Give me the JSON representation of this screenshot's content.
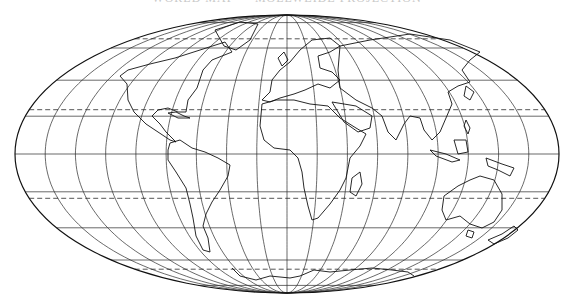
{
  "map": {
    "title": "WORLD MAP — MOLLWEIDE PROJECTION",
    "projection": "Mollweide",
    "center": [
      287,
      154
    ],
    "rx": 272,
    "ry": 139,
    "colors": {
      "line": "#111111",
      "background": "#ffffff"
    },
    "graticule": {
      "meridian_step_deg": 20,
      "solid_parallels_deg": [
        -80,
        -60,
        -40,
        -20,
        0,
        20,
        40,
        60,
        80
      ],
      "dashed_parallels_deg": [
        66.5,
        23.5,
        -23.5,
        -66.5
      ],
      "dashed_labels": [
        "Arctic Circle",
        "Tropic of Cancer",
        "Tropic of Capricorn",
        "Antarctic Circle"
      ]
    },
    "landmasses": [
      {
        "name": "North America",
        "points": [
          [
            128,
            70
          ],
          [
            150,
            64
          ],
          [
            175,
            58
          ],
          [
            200,
            50
          ],
          [
            225,
            42
          ],
          [
            232,
            52
          ],
          [
            212,
            60
          ],
          [
            203,
            70
          ],
          [
            197,
            88
          ],
          [
            188,
            100
          ],
          [
            186,
            112
          ],
          [
            178,
            112
          ],
          [
            168,
            108
          ],
          [
            158,
            110
          ],
          [
            152,
            116
          ],
          [
            160,
            124
          ],
          [
            166,
            132
          ],
          [
            172,
            138
          ],
          [
            176,
            142
          ],
          [
            170,
            140
          ],
          [
            158,
            132
          ],
          [
            146,
            124
          ],
          [
            134,
            112
          ],
          [
            128,
            100
          ],
          [
            127,
            84
          ],
          [
            120,
            76
          ],
          [
            128,
            70
          ]
        ]
      },
      {
        "name": "Greenland",
        "points": [
          [
            215,
            30
          ],
          [
            240,
            22
          ],
          [
            258,
            24
          ],
          [
            250,
            40
          ],
          [
            236,
            50
          ],
          [
            224,
            46
          ],
          [
            215,
            30
          ]
        ]
      },
      {
        "name": "Cuba",
        "points": [
          [
            168,
            113
          ],
          [
            176,
            112
          ],
          [
            184,
            116
          ],
          [
            190,
            118
          ],
          [
            178,
            118
          ],
          [
            168,
            113
          ]
        ]
      },
      {
        "name": "South America",
        "points": [
          [
            170,
            143
          ],
          [
            180,
            140
          ],
          [
            192,
            148
          ],
          [
            205,
            152
          ],
          [
            218,
            158
          ],
          [
            230,
            165
          ],
          [
            228,
            176
          ],
          [
            220,
            190
          ],
          [
            212,
            202
          ],
          [
            206,
            214
          ],
          [
            203,
            226
          ],
          [
            208,
            238
          ],
          [
            210,
            252
          ],
          [
            203,
            250
          ],
          [
            196,
            236
          ],
          [
            193,
            218
          ],
          [
            190,
            204
          ],
          [
            186,
            188
          ],
          [
            176,
            172
          ],
          [
            168,
            160
          ],
          [
            168,
            150
          ],
          [
            170,
            143
          ]
        ]
      },
      {
        "name": "Europe",
        "points": [
          [
            262,
            100
          ],
          [
            270,
            92
          ],
          [
            272,
            80
          ],
          [
            280,
            70
          ],
          [
            290,
            62
          ],
          [
            300,
            50
          ],
          [
            312,
            40
          ],
          [
            330,
            38
          ],
          [
            340,
            46
          ],
          [
            330,
            52
          ],
          [
            318,
            56
          ],
          [
            320,
            68
          ],
          [
            332,
            72
          ],
          [
            340,
            80
          ],
          [
            330,
            88
          ],
          [
            318,
            84
          ],
          [
            305,
            90
          ],
          [
            294,
            94
          ],
          [
            280,
            98
          ],
          [
            270,
            102
          ],
          [
            262,
            100
          ]
        ]
      },
      {
        "name": "British Isles",
        "points": [
          [
            278,
            58
          ],
          [
            284,
            52
          ],
          [
            288,
            60
          ],
          [
            282,
            66
          ],
          [
            278,
            58
          ]
        ]
      },
      {
        "name": "Africa",
        "points": [
          [
            262,
            104
          ],
          [
            276,
            100
          ],
          [
            294,
            100
          ],
          [
            310,
            104
          ],
          [
            328,
            106
          ],
          [
            340,
            118
          ],
          [
            356,
            128
          ],
          [
            366,
            134
          ],
          [
            360,
            146
          ],
          [
            350,
            158
          ],
          [
            346,
            178
          ],
          [
            340,
            190
          ],
          [
            330,
            204
          ],
          [
            318,
            218
          ],
          [
            312,
            220
          ],
          [
            308,
            206
          ],
          [
            304,
            188
          ],
          [
            302,
            172
          ],
          [
            298,
            158
          ],
          [
            290,
            150
          ],
          [
            274,
            148
          ],
          [
            264,
            140
          ],
          [
            260,
            126
          ],
          [
            262,
            104
          ]
        ]
      },
      {
        "name": "Madagascar",
        "points": [
          [
            352,
            178
          ],
          [
            360,
            172
          ],
          [
            362,
            184
          ],
          [
            356,
            196
          ],
          [
            350,
            192
          ],
          [
            352,
            178
          ]
        ]
      },
      {
        "name": "Arabia",
        "points": [
          [
            332,
            102
          ],
          [
            356,
            106
          ],
          [
            372,
            116
          ],
          [
            370,
            128
          ],
          [
            358,
            132
          ],
          [
            344,
            122
          ],
          [
            332,
            102
          ]
        ]
      },
      {
        "name": "Asia",
        "points": [
          [
            340,
            46
          ],
          [
            370,
            40
          ],
          [
            410,
            34
          ],
          [
            450,
            40
          ],
          [
            480,
            52
          ],
          [
            470,
            60
          ],
          [
            462,
            70
          ],
          [
            470,
            82
          ],
          [
            458,
            86
          ],
          [
            448,
            92
          ],
          [
            452,
            104
          ],
          [
            446,
            118
          ],
          [
            440,
            132
          ],
          [
            432,
            140
          ],
          [
            424,
            130
          ],
          [
            420,
            118
          ],
          [
            410,
            116
          ],
          [
            404,
            124
          ],
          [
            396,
            140
          ],
          [
            388,
            132
          ],
          [
            382,
            116
          ],
          [
            372,
            108
          ],
          [
            356,
            100
          ],
          [
            340,
            88
          ],
          [
            338,
            70
          ],
          [
            340,
            46
          ]
        ]
      },
      {
        "name": "Japan",
        "points": [
          [
            466,
            86
          ],
          [
            474,
            92
          ],
          [
            470,
            100
          ],
          [
            464,
            96
          ],
          [
            466,
            86
          ]
        ]
      },
      {
        "name": "Indonesia",
        "points": [
          [
            430,
            150
          ],
          [
            446,
            154
          ],
          [
            460,
            160
          ],
          [
            452,
            162
          ],
          [
            436,
            156
          ],
          [
            430,
            150
          ]
        ]
      },
      {
        "name": "Borneo",
        "points": [
          [
            454,
            140
          ],
          [
            466,
            140
          ],
          [
            468,
            152
          ],
          [
            458,
            154
          ],
          [
            454,
            140
          ]
        ]
      },
      {
        "name": "Philippines",
        "points": [
          [
            466,
            120
          ],
          [
            470,
            128
          ],
          [
            468,
            134
          ],
          [
            464,
            126
          ],
          [
            466,
            120
          ]
        ]
      },
      {
        "name": "New Guinea",
        "points": [
          [
            486,
            158
          ],
          [
            502,
            164
          ],
          [
            514,
            168
          ],
          [
            510,
            176
          ],
          [
            498,
            170
          ],
          [
            488,
            166
          ],
          [
            486,
            158
          ]
        ]
      },
      {
        "name": "Australia",
        "points": [
          [
            444,
            196
          ],
          [
            458,
            186
          ],
          [
            470,
            180
          ],
          [
            480,
            176
          ],
          [
            494,
            180
          ],
          [
            502,
            194
          ],
          [
            502,
            210
          ],
          [
            494,
            222
          ],
          [
            482,
            228
          ],
          [
            470,
            224
          ],
          [
            460,
            216
          ],
          [
            446,
            220
          ],
          [
            442,
            210
          ],
          [
            444,
            196
          ]
        ]
      },
      {
        "name": "Tasmania",
        "points": [
          [
            468,
            230
          ],
          [
            474,
            232
          ],
          [
            472,
            238
          ],
          [
            466,
            236
          ],
          [
            468,
            230
          ]
        ]
      },
      {
        "name": "New Zealand",
        "points": [
          [
            488,
            240
          ],
          [
            502,
            234
          ],
          [
            514,
            226
          ],
          [
            518,
            230
          ],
          [
            508,
            238
          ],
          [
            494,
            244
          ],
          [
            488,
            240
          ]
        ]
      },
      {
        "name": "Antarctica",
        "points": [
          [
            232,
            268
          ],
          [
            240,
            276
          ],
          [
            256,
            280
          ],
          [
            270,
            276
          ],
          [
            290,
            278
          ],
          [
            300,
            276
          ],
          [
            314,
            270
          ],
          [
            330,
            272
          ],
          [
            350,
            270
          ],
          [
            372,
            268
          ],
          [
            392,
            270
          ],
          [
            408,
            272
          ],
          [
            414,
            276
          ]
        ]
      }
    ]
  }
}
